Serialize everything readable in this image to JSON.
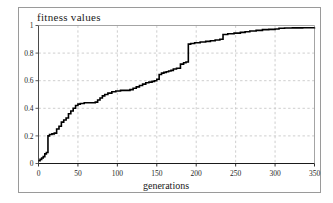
{
  "figure": {
    "title": "fitness values",
    "border_color": "#9a9a9a",
    "background": "#ffffff"
  },
  "chart_data": {
    "type": "line",
    "title": "fitness values",
    "xlabel": "generations",
    "ylabel": "",
    "xlim": [
      0,
      350
    ],
    "ylim": [
      0,
      1
    ],
    "grid": true,
    "grid_style": "dashed",
    "grid_color": "#c8c8c8",
    "line_color": "#000000",
    "line_width": 1.6,
    "step_style": "post",
    "legend": false,
    "xticks": [
      0,
      50,
      100,
      150,
      200,
      250,
      300,
      350
    ],
    "xtick_labels": [
      "0",
      "50",
      "100",
      "150",
      "200",
      "250",
      "300",
      "350"
    ],
    "yticks": [
      0,
      0.2,
      0.4,
      0.6,
      0.8,
      1
    ],
    "ytick_labels": [
      "0",
      "0.2",
      "0.4",
      "0.6",
      "0.8",
      "1"
    ],
    "series": [
      {
        "name": "best fitness",
        "x": [
          0,
          2,
          4,
          6,
          8,
          10,
          12,
          14,
          17,
          20,
          23,
          26,
          29,
          32,
          35,
          38,
          41,
          44,
          47,
          50,
          53,
          58,
          63,
          68,
          72,
          75,
          78,
          81,
          84,
          88,
          93,
          98,
          104,
          110,
          116,
          120,
          124,
          128,
          132,
          136,
          140,
          144,
          147,
          150,
          153,
          156,
          159,
          162,
          165,
          168,
          171,
          175,
          180,
          184,
          187,
          190,
          193,
          198,
          205,
          212,
          218,
          224,
          230,
          234,
          240,
          248,
          256,
          262,
          268,
          276,
          284,
          292,
          300,
          305,
          312,
          322,
          335,
          350
        ],
        "y": [
          0.02,
          0.03,
          0.04,
          0.05,
          0.07,
          0.08,
          0.2,
          0.21,
          0.215,
          0.22,
          0.25,
          0.27,
          0.3,
          0.315,
          0.33,
          0.36,
          0.38,
          0.4,
          0.42,
          0.43,
          0.435,
          0.44,
          0.44,
          0.44,
          0.445,
          0.46,
          0.475,
          0.49,
          0.5,
          0.51,
          0.52,
          0.525,
          0.53,
          0.53,
          0.535,
          0.545,
          0.555,
          0.565,
          0.575,
          0.585,
          0.59,
          0.595,
          0.6,
          0.61,
          0.645,
          0.655,
          0.66,
          0.665,
          0.67,
          0.675,
          0.685,
          0.69,
          0.72,
          0.73,
          0.735,
          0.865,
          0.87,
          0.875,
          0.88,
          0.885,
          0.89,
          0.895,
          0.9,
          0.935,
          0.94,
          0.945,
          0.95,
          0.955,
          0.96,
          0.965,
          0.97,
          0.972,
          0.975,
          0.98,
          0.982,
          0.983,
          0.984,
          0.985
        ]
      }
    ]
  }
}
